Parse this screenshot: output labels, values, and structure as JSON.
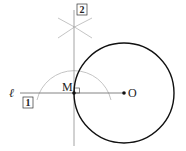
{
  "diagram": {
    "labels": {
      "line": "ℓ",
      "point_m": "M",
      "point_o": "O",
      "step1": "1",
      "step2": "2"
    },
    "colors": {
      "construction": "#b8b8b8",
      "line": "#777777",
      "circle": "#111111",
      "point": "#111111"
    },
    "elements": {
      "point_m": {
        "x": 74,
        "y": 93
      },
      "point_o": {
        "x": 124,
        "y": 93
      },
      "circle": {
        "cx": 124,
        "cy": 93,
        "r": 50
      },
      "construction_arc": {
        "cx": 74,
        "cy": 93,
        "r": 38
      },
      "perpendicular": {
        "x": 74,
        "y1": 8,
        "y2": 146
      },
      "line_l": {
        "y": 93,
        "x1": 20,
        "x2": 124
      }
    }
  }
}
